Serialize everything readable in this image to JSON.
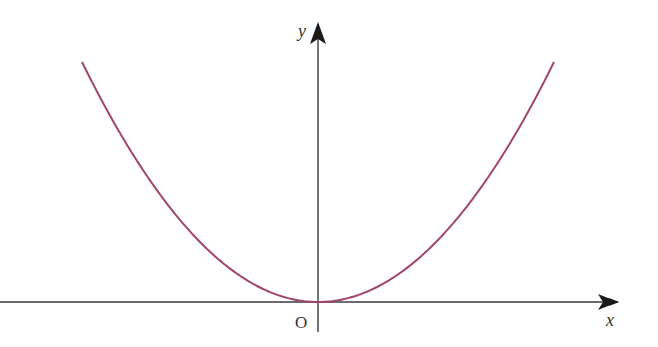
{
  "chart_data": {
    "type": "line",
    "title": "",
    "xlabel": "x",
    "ylabel": "y",
    "origin_label": "O",
    "grid": false,
    "legend": null,
    "series": [
      {
        "name": "y = kx^2",
        "color": "#a0456e",
        "function": "parabola, vertex at origin, opening upward"
      }
    ]
  },
  "labels": {
    "x_axis": "x",
    "y_axis": "y",
    "origin": "O"
  },
  "colors": {
    "curve": "#a0456e",
    "axes": "#3a3a3a",
    "background": "#ffffff"
  }
}
